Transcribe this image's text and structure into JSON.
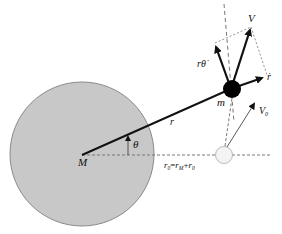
{
  "diagram": {
    "type": "orbital-mechanics",
    "labels": {
      "central_mass": "M",
      "orbiting_mass": "m",
      "radius": "r",
      "angle": "θ",
      "velocity": "V",
      "tangential_velocity": "rθ̇",
      "radial_velocity": "ṙ",
      "initial_velocity": "V",
      "initial_velocity_sub": "0",
      "initial_radius_lhs": "r",
      "initial_radius_lhs_sub": "0",
      "initial_radius_eq": "=",
      "initial_radius_rm": "r",
      "initial_radius_rm_sub": "M",
      "initial_radius_plus": "+",
      "initial_radius_r0": "r",
      "initial_radius_r0_sub": "0"
    },
    "colors": {
      "planet_fill": "#c8c8c8",
      "planet_stroke": "#8a8a8a",
      "body_fill": "#000000",
      "initial_body_fill": "#f4f4f4",
      "dash": "#777777",
      "arrow": "#111111"
    }
  }
}
